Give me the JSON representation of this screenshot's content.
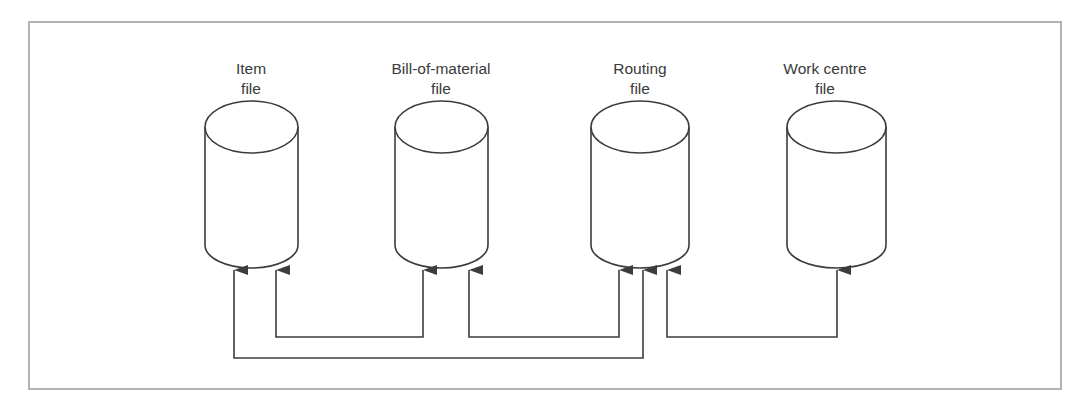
{
  "diagram": {
    "type": "data-flow",
    "stores": [
      {
        "id": "item",
        "line1": "Item",
        "line2": "file"
      },
      {
        "id": "bom",
        "line1": "Bill-of-material",
        "line2": "file"
      },
      {
        "id": "routing",
        "line1": "Routing",
        "line2": "file"
      },
      {
        "id": "workcentre",
        "line1": "Work centre",
        "line2": "file"
      }
    ],
    "connections": [
      {
        "from": "item",
        "to": "bom",
        "description": "Item file linked to Bill-of-material file"
      },
      {
        "from": "bom",
        "to": "routing",
        "description": "Bill-of-material file linked to Routing file"
      },
      {
        "from": "item",
        "to": "routing",
        "description": "Item file linked to Routing file"
      },
      {
        "from": "routing",
        "to": "workcentre",
        "description": "Routing file linked to Work centre file"
      }
    ],
    "colors": {
      "border": "#b3b3b3",
      "stroke": "#3c3c3c",
      "text": "#3a3a3a"
    }
  }
}
